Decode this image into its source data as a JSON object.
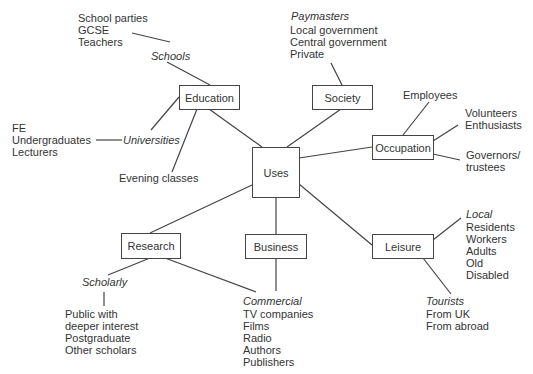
{
  "nodes": {
    "uses": "Uses",
    "education": "Education",
    "society": "Society",
    "occupation": "Occupation",
    "research": "Research",
    "business": "Business",
    "leisure": "Leisure"
  },
  "education": {
    "schools": {
      "label": "Schools",
      "items": [
        "School parties",
        "GCSE",
        "Teachers"
      ]
    },
    "universities": {
      "label": "Universities",
      "items": [
        "FE",
        "Undergraduates",
        "Lecturers"
      ]
    },
    "evening": "Evening classes"
  },
  "society": {
    "paymasters": {
      "label": "Paymasters",
      "items": [
        "Local government",
        "Central government",
        "Private"
      ]
    }
  },
  "occupation": {
    "employees": "Employees",
    "volunteers": [
      "Volunteers",
      "Enthusiasts"
    ],
    "governors": [
      "Governors/",
      "trustees"
    ]
  },
  "research": {
    "scholarly": {
      "label": "Scholarly",
      "items": [
        "Public with",
        "deeper interest",
        "Postgraduate",
        "Other scholars"
      ]
    }
  },
  "business": {
    "commercial": {
      "label": "Commercial",
      "items": [
        "TV companies",
        "Films",
        "Radio",
        "Authors",
        "Publishers"
      ]
    }
  },
  "leisure": {
    "local": {
      "label": "Local",
      "items": [
        "Residents",
        "Workers",
        "Adults",
        "Old",
        "Disabled"
      ]
    },
    "tourists": {
      "label": "Tourists",
      "items": [
        "From UK",
        "From abroad"
      ]
    }
  }
}
